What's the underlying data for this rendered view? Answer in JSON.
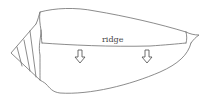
{
  "diagram": {
    "labels": {
      "ridge": "ridge"
    },
    "arrows": [
      {
        "direction": "down",
        "x": 80
      },
      {
        "direction": "down",
        "x": 147
      }
    ],
    "colors": {
      "line": "#6e6e6e",
      "background": "#ffffff"
    }
  }
}
